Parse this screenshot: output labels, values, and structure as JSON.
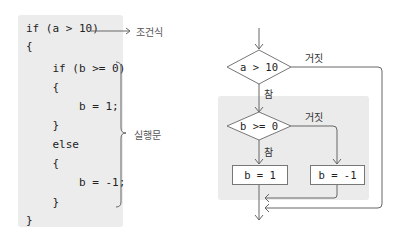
{
  "code": {
    "lines": [
      "if (a > 10)",
      "{",
      "    if (b >= 0)",
      "    {",
      "        b = 1;",
      "    }",
      "    else",
      "    {",
      "        b = -1;",
      "    }",
      "}"
    ],
    "annotations": {
      "condition_label": "조건식",
      "statement_label": "실행문"
    }
  },
  "flowchart": {
    "outer_condition": "a > 10",
    "inner_condition": "b >= 0",
    "true_label": "참",
    "false_label": "거짓",
    "true_box": "b = 1",
    "false_box": "b = -1"
  }
}
